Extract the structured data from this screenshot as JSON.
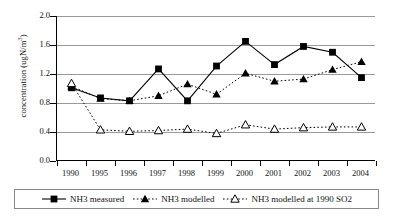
{
  "chart_data": {
    "type": "line",
    "title": "",
    "xlabel": "",
    "ylabel": "concentration (ugN/m3)",
    "ylabel_prefix": "concentration (ugN/m",
    "ylabel_sup": "3",
    "ylabel_suffix": ")",
    "categories": [
      "1990",
      "1995",
      "1996",
      "1997",
      "1998",
      "1999",
      "2000",
      "2001",
      "2002",
      "2003",
      "2004"
    ],
    "ylim": [
      0.0,
      2.0
    ],
    "ytick_labels": [
      "2.0",
      "1.6",
      "1.2",
      "0.8",
      "0.4",
      "0.0"
    ],
    "ytick_values": [
      2.0,
      1.6,
      1.2,
      0.8,
      0.4,
      0.0
    ],
    "grid": "horizontal",
    "legend_position": "bottom",
    "series": [
      {
        "name": "NH3 measured",
        "marker": "filled-square",
        "line": "solid",
        "values": [
          1.01,
          0.87,
          0.83,
          1.27,
          0.83,
          1.31,
          1.65,
          1.33,
          1.58,
          1.5,
          1.15
        ]
      },
      {
        "name": "NH3 modelled",
        "marker": "filled-triangle",
        "line": "dotted",
        "values": [
          1.03,
          0.86,
          0.83,
          0.9,
          1.06,
          0.92,
          1.21,
          1.1,
          1.13,
          1.26,
          1.37
        ]
      },
      {
        "name": "NH3 modelled at 1990 SO2",
        "marker": "open-triangle",
        "line": "dotted",
        "values": [
          1.07,
          0.43,
          0.41,
          0.42,
          0.44,
          0.38,
          0.5,
          0.44,
          0.46,
          0.47,
          0.47
        ]
      }
    ]
  },
  "legend": {
    "items": [
      {
        "label": "NH3 measured",
        "marker": "filled-square",
        "line": "solid"
      },
      {
        "label": "NH3 modelled",
        "marker": "filled-triangle",
        "line": "dotted"
      },
      {
        "label": "NH3 modelled at 1990 SO2",
        "marker": "open-triangle",
        "line": "dotted"
      }
    ]
  }
}
